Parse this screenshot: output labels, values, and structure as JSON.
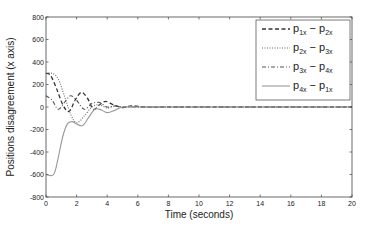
{
  "chart_data": {
    "type": "line",
    "title": "",
    "xlabel": "Time (seconds)",
    "ylabel": "Positions disagreement (x axis)",
    "xlim": [
      0,
      20
    ],
    "ylim": [
      -800,
      800
    ],
    "xticks": [
      0,
      2,
      4,
      6,
      8,
      10,
      12,
      14,
      16,
      18,
      20
    ],
    "yticks": [
      800,
      600,
      400,
      200,
      0,
      -200,
      -400,
      -600,
      -800
    ],
    "grid": false,
    "legend_position": "upper right",
    "series": [
      {
        "name": "p1x - p2x",
        "label_main": [
          "p",
          "1x",
          " − p",
          "2x"
        ],
        "style": "dashed",
        "color": "#333333",
        "x": [
          0,
          0.3,
          0.7,
          1.1,
          1.5,
          1.9,
          2.3,
          2.7,
          3.1,
          3.5,
          3.9,
          4.4,
          5.0,
          5.6,
          6.5,
          8,
          10,
          20
        ],
        "y": [
          300,
          280,
          160,
          20,
          -40,
          60,
          130,
          80,
          -20,
          20,
          50,
          20,
          -5,
          10,
          0,
          0,
          0,
          0
        ]
      },
      {
        "name": "p2x - p3x",
        "label_main": [
          "p",
          "2x",
          " − p",
          "3x"
        ],
        "style": "dotted",
        "color": "#666666",
        "x": [
          0,
          0.4,
          0.8,
          1.2,
          1.6,
          2.0,
          2.5,
          3.0,
          3.5,
          4.0,
          4.5,
          5.0,
          6.0,
          8,
          20
        ],
        "y": [
          300,
          300,
          250,
          100,
          -60,
          -140,
          -80,
          0,
          20,
          -10,
          10,
          0,
          0,
          0,
          0
        ]
      },
      {
        "name": "p3x - p4x",
        "label_main": [
          "p",
          "3x",
          " − p",
          "4x"
        ],
        "style": "dashdot",
        "color": "#555555",
        "x": [
          0,
          0.4,
          0.8,
          1.2,
          1.6,
          2.0,
          2.5,
          3.0,
          3.5,
          4.0,
          4.5,
          5.0,
          6.0,
          8,
          20
        ],
        "y": [
          100,
          60,
          -20,
          40,
          100,
          60,
          -20,
          30,
          40,
          0,
          10,
          0,
          0,
          0,
          0
        ]
      },
      {
        "name": "p4x - p1x",
        "label_main": [
          "p",
          "4x",
          " − p",
          "1x"
        ],
        "style": "solid",
        "color": "#999999",
        "x": [
          0,
          0.5,
          0.8,
          1.1,
          1.4,
          1.7,
          2.0,
          2.4,
          2.8,
          3.2,
          3.6,
          4.0,
          4.5,
          5.0,
          6.0,
          8,
          20
        ],
        "y": [
          -600,
          -600,
          -450,
          -260,
          -150,
          -130,
          -150,
          -165,
          -90,
          -20,
          -25,
          -50,
          -30,
          0,
          0,
          0,
          0
        ]
      }
    ]
  }
}
